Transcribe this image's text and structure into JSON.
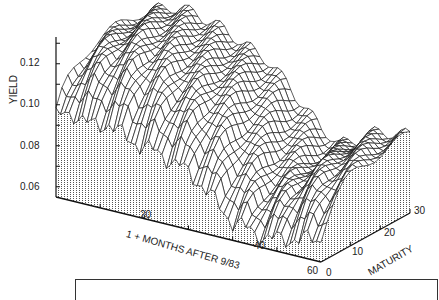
{
  "chart_data": {
    "type": "surface3d",
    "title": "",
    "xlabel": "1 + MONTHS AFTER 9/83",
    "ylabel": "YIELD",
    "zlabel": "MATURITY",
    "yield_ticks": [
      "0.06",
      "0.08",
      "0.10",
      "0.12"
    ],
    "yield_tick_values": [
      0.06,
      0.08,
      0.1,
      0.12
    ],
    "month_ticks": [
      "20",
      "40",
      "60"
    ],
    "maturity_ticks": [
      "0",
      "10",
      "20",
      "30"
    ],
    "ylim": [
      0.055,
      0.13
    ],
    "month_range": [
      1,
      61
    ],
    "maturity_range": [
      0,
      30
    ],
    "months": [
      1,
      5,
      9,
      13,
      17,
      21,
      25,
      29,
      33,
      37,
      41,
      45,
      49,
      53,
      57,
      61
    ],
    "series": [
      {
        "name": "short end (maturity 0)",
        "values": [
          0.094,
          0.098,
          0.094,
          0.097,
          0.092,
          0.09,
          0.088,
          0.085,
          0.08,
          0.072,
          0.064,
          0.062,
          0.06,
          0.062,
          0.064,
          0.066
        ]
      },
      {
        "name": "long end (maturity 30)",
        "values": [
          0.122,
          0.125,
          0.128,
          0.126,
          0.124,
          0.12,
          0.116,
          0.112,
          0.104,
          0.094,
          0.086,
          0.08,
          0.084,
          0.09,
          0.092,
          0.093
        ]
      }
    ],
    "grid": false,
    "legend": "none"
  },
  "labels": {
    "yield_axis": "YIELD",
    "month_axis": "1 + MONTHS AFTER 9/83",
    "maturity_axis": "MATURITY"
  }
}
